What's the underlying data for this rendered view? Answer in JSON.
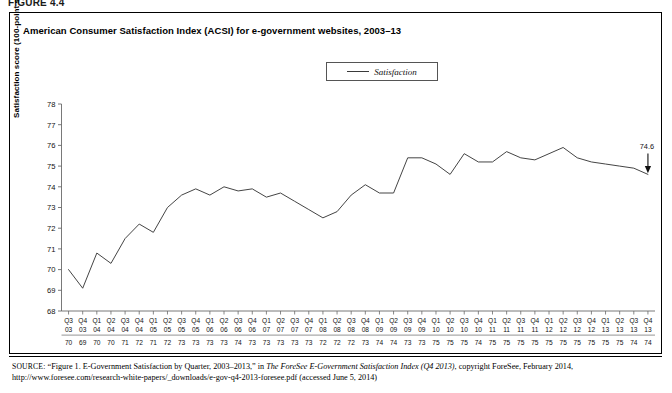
{
  "figure": {
    "number_label": "FIGURE 4.4",
    "title": "American Consumer Satisfaction Index (ACSI) for e-government websites, 2003–13"
  },
  "legend": {
    "entries": [
      {
        "label": "Satisfaction",
        "color": "#3a3a3a",
        "marker": "line"
      }
    ]
  },
  "annotation": {
    "end_value_label": "74.6",
    "arrow": "down-arrow-icon"
  },
  "source": {
    "kicker": "SOURCE:",
    "line1_pre": "“Figure 1. E-Government Satisfaction by Quarter, 2003–2013,” in ",
    "line1_italic": "The ForeSee E-Government Satisfaction Index (Q4 2013)",
    "line1_post": ", copyright ForeSee,",
    "line2": "February 2014, http://www.foresee.com/research-white-papers/_downloads/e-gov-q4-2013-foresee.pdf (accessed June 5, 2014)"
  },
  "chart_data": {
    "type": "line",
    "title": "American Consumer Satisfaction Index (ACSI) for e-government websites, 2003–13",
    "xlabel": "",
    "ylabel": "Satisfaction score (100-point scale)",
    "ylim": [
      68,
      78
    ],
    "ytick_step": 1,
    "yticks": [
      68,
      69,
      70,
      71,
      72,
      73,
      74,
      75,
      76,
      77,
      78
    ],
    "grid": false,
    "legend_position": "top-center",
    "x_quarters": [
      "Q3",
      "Q4",
      "Q1",
      "Q2",
      "Q3",
      "Q4",
      "Q1",
      "Q2",
      "Q3",
      "Q4",
      "Q1",
      "Q2",
      "Q3",
      "Q4",
      "Q1",
      "Q2",
      "Q3",
      "Q4",
      "Q1",
      "Q2",
      "Q3",
      "Q4",
      "Q1",
      "Q2",
      "Q3",
      "Q4",
      "Q1",
      "Q2",
      "Q3",
      "Q4",
      "Q1",
      "Q2",
      "Q3",
      "Q4",
      "Q1",
      "Q2",
      "Q3",
      "Q4",
      "Q1",
      "Q2",
      "Q3",
      "Q4"
    ],
    "x_years": [
      "03",
      "03",
      "04",
      "04",
      "04",
      "04",
      "05",
      "05",
      "05",
      "05",
      "06",
      "06",
      "06",
      "06",
      "07",
      "07",
      "07",
      "07",
      "08",
      "08",
      "08",
      "08",
      "09",
      "09",
      "09",
      "09",
      "10",
      "10",
      "10",
      "10",
      "11",
      "11",
      "11",
      "11",
      "12",
      "12",
      "12",
      "12",
      "13",
      "13",
      "13",
      "13"
    ],
    "x_value_row": [
      "70",
      "69",
      "70",
      "70",
      "71",
      "72",
      "71",
      "72",
      "73",
      "73",
      "73",
      "73",
      "74",
      "73",
      "73",
      "73",
      "73",
      "73",
      "72",
      "72",
      "72",
      "73",
      "74",
      "74",
      "73",
      "73",
      "75",
      "75",
      "75",
      "74",
      "75",
      "75",
      "75",
      "75",
      "75",
      "75",
      "75",
      "75",
      "75",
      "75",
      "74",
      "74"
    ],
    "series": [
      {
        "name": "Satisfaction",
        "color": "#3a3a3a",
        "values": [
          70.0,
          69.1,
          70.8,
          70.3,
          71.5,
          72.2,
          71.8,
          73.0,
          73.6,
          73.9,
          73.6,
          74.0,
          73.8,
          73.9,
          73.5,
          73.7,
          73.3,
          72.9,
          72.5,
          72.8,
          73.6,
          74.1,
          73.7,
          73.7,
          75.4,
          75.4,
          75.1,
          74.6,
          75.6,
          75.2,
          75.2,
          75.7,
          75.4,
          75.3,
          75.6,
          75.9,
          75.4,
          75.2,
          75.1,
          75.0,
          74.9,
          74.6
        ]
      }
    ],
    "annotations": [
      {
        "text": "74.6",
        "x_index": 41,
        "y": 74.6,
        "type": "arrow-callout"
      }
    ]
  }
}
